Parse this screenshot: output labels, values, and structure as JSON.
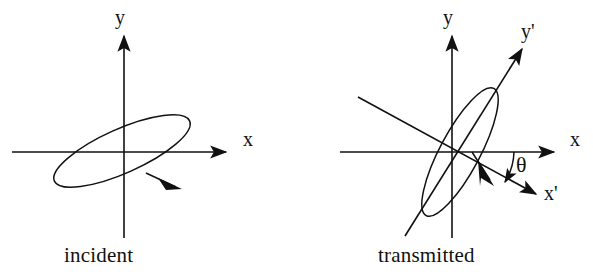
{
  "figure": {
    "width": 593,
    "height": 274,
    "background": "#ffffff",
    "stroke_color": "#111111"
  },
  "panels": [
    {
      "id": "incident",
      "caption": "incident",
      "origin": {
        "x": 124,
        "y": 152
      },
      "axes": [
        {
          "name": "x-axis",
          "label": "x",
          "label_pos": {
            "x": 243,
            "y": 140
          },
          "from": {
            "x": 12,
            "y": 152
          },
          "to": {
            "x": 228,
            "y": 152
          },
          "arrow": true
        },
        {
          "name": "y-axis",
          "label": "y",
          "label_pos": {
            "x": 116,
            "y": 10
          },
          "from": {
            "x": 124,
            "y": 238
          },
          "to": {
            "x": 124,
            "y": 34
          },
          "arrow": true
        }
      ],
      "ellipse": {
        "name": "polarization-ellipse",
        "center": {
          "x": 122,
          "y": 151
        },
        "semi_major": 74,
        "semi_minor": 22,
        "tilt_deg": -24,
        "handedness": "clockwise",
        "direction_arrow_at_deg": 18
      }
    },
    {
      "id": "transmitted",
      "caption": "transmitted",
      "origin": {
        "x": 452,
        "y": 152
      },
      "axes": [
        {
          "name": "x-axis",
          "label": "x",
          "label_pos": {
            "x": 572,
            "y": 140
          },
          "from": {
            "x": 340,
            "y": 152
          },
          "to": {
            "x": 556,
            "y": 152
          },
          "arrow": true
        },
        {
          "name": "y-axis",
          "label": "y",
          "label_pos": {
            "x": 444,
            "y": 10
          },
          "from": {
            "x": 452,
            "y": 238
          },
          "to": {
            "x": 452,
            "y": 34
          },
          "arrow": true
        },
        {
          "name": "x-prime-axis",
          "label": "x'",
          "label_pos": {
            "x": 545,
            "y": 190
          },
          "from": {
            "x": 358,
            "y": 97
          },
          "to": {
            "x": 538,
            "y": 195
          },
          "arrow": true,
          "angle_from_x_deg": -28
        },
        {
          "name": "y-prime-axis",
          "label": "y'",
          "label_pos": {
            "x": 522,
            "y": 28
          },
          "from": {
            "x": 405,
            "y": 236
          },
          "to": {
            "x": 524,
            "y": 47
          },
          "arrow": true,
          "angle_from_x_deg": 58
        }
      ],
      "angle_marker": {
        "name": "theta-angle",
        "label": "θ",
        "label_pos": {
          "x": 516,
          "y": 160
        },
        "between": [
          "x-axis",
          "x-prime-axis"
        ],
        "arc_radius": 62,
        "arrow": true
      },
      "ellipse": {
        "name": "polarization-ellipse",
        "center": {
          "x": 460,
          "y": 152
        },
        "semi_major": 72,
        "semi_minor": 20,
        "tilt_deg": -62,
        "handedness": "clockwise",
        "direction_arrow_at_deg": 18
      }
    }
  ]
}
